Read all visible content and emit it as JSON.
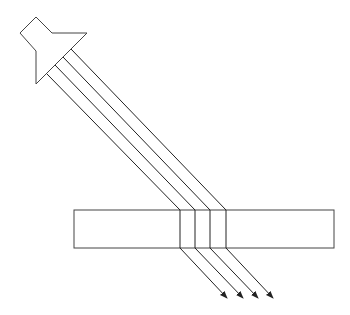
{
  "diagram": {
    "title": "",
    "colors": {
      "stroke": "#444444",
      "ray": "#222222",
      "background": "#ffffff"
    },
    "source": {
      "points": "20,33 36,17 52,33 87,33 36,84 36,51"
    },
    "slab": {
      "x": 74,
      "y": 210,
      "width": 260,
      "height": 38
    },
    "rays": [
      {
        "start": [
          47,
          74
        ],
        "entry": [
          180,
          210
        ],
        "exit": [
          180,
          248
        ],
        "end": [
          227,
          298
        ]
      },
      {
        "start": [
          55,
          65
        ],
        "entry": [
          195,
          210
        ],
        "exit": [
          195,
          248
        ],
        "end": [
          243,
          298
        ]
      },
      {
        "start": [
          63,
          57
        ],
        "entry": [
          210,
          210
        ],
        "exit": [
          210,
          248
        ],
        "end": [
          258,
          298
        ]
      },
      {
        "start": [
          71,
          49
        ],
        "entry": [
          226,
          210
        ],
        "exit": [
          226,
          248
        ],
        "end": [
          273,
          298
        ]
      }
    ]
  }
}
